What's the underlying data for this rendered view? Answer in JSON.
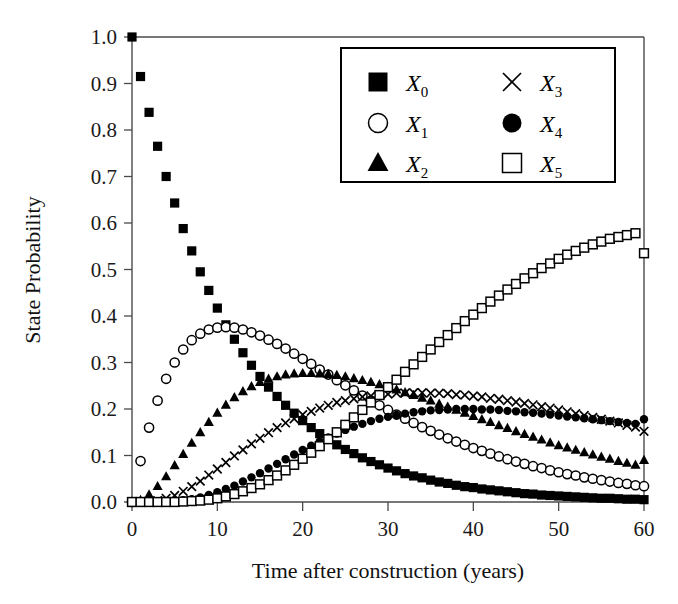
{
  "chart_data": {
    "type": "scatter",
    "title": "",
    "xlabel": "Time after construction (years)",
    "ylabel": "State Probability",
    "xlim": [
      0,
      60
    ],
    "ylim": [
      0.0,
      1.0
    ],
    "grid": false,
    "legend_position": "top-right",
    "xticks": [
      0,
      10,
      20,
      30,
      40,
      50,
      60
    ],
    "xtick_labels": [
      "0",
      "10",
      "20",
      "30",
      "40",
      "50",
      "60"
    ],
    "yticks": [
      0.0,
      0.1,
      0.2,
      0.3,
      0.4,
      0.5,
      0.6,
      0.7,
      0.8,
      0.9,
      1.0
    ],
    "ytick_labels": [
      "0.0",
      "0.1",
      "0.2",
      "0.3",
      "0.4",
      "0.5",
      "0.6",
      "0.7",
      "0.8",
      "0.9",
      "1.0"
    ],
    "x": [
      0,
      1,
      2,
      3,
      4,
      5,
      6,
      7,
      8,
      9,
      10,
      11,
      12,
      13,
      14,
      15,
      16,
      17,
      18,
      19,
      20,
      21,
      22,
      23,
      24,
      25,
      26,
      27,
      28,
      29,
      30,
      31,
      32,
      33,
      34,
      35,
      36,
      37,
      38,
      39,
      40,
      41,
      42,
      43,
      44,
      45,
      46,
      47,
      48,
      49,
      50,
      51,
      52,
      53,
      54,
      55,
      56,
      57,
      58,
      59,
      60
    ],
    "series": [
      {
        "name": "X0",
        "marker": "filled-square",
        "values": [
          1.0,
          0.915,
          0.838,
          0.765,
          0.7,
          0.643,
          0.588,
          0.54,
          0.495,
          0.455,
          0.417,
          0.381,
          0.35,
          0.321,
          0.294,
          0.27,
          0.247,
          0.227,
          0.208,
          0.191,
          0.175,
          0.16,
          0.147,
          0.135,
          0.123,
          0.113,
          0.104,
          0.095,
          0.087,
          0.08,
          0.073,
          0.067,
          0.061,
          0.056,
          0.052,
          0.047,
          0.043,
          0.04,
          0.036,
          0.033,
          0.031,
          0.028,
          0.026,
          0.024,
          0.022,
          0.02,
          0.018,
          0.017,
          0.015,
          0.014,
          0.013,
          0.012,
          0.011,
          0.01,
          0.009,
          0.008,
          0.008,
          0.007,
          0.006,
          0.006,
          0.005
        ]
      },
      {
        "name": "X1",
        "marker": "open-circle",
        "values": [
          0.0,
          0.088,
          0.16,
          0.218,
          0.265,
          0.3,
          0.328,
          0.348,
          0.362,
          0.371,
          0.375,
          0.376,
          0.375,
          0.371,
          0.365,
          0.358,
          0.349,
          0.34,
          0.33,
          0.319,
          0.308,
          0.297,
          0.285,
          0.274,
          0.262,
          0.251,
          0.24,
          0.229,
          0.218,
          0.208,
          0.198,
          0.188,
          0.179,
          0.17,
          0.161,
          0.153,
          0.145,
          0.137,
          0.13,
          0.123,
          0.116,
          0.11,
          0.104,
          0.098,
          0.092,
          0.087,
          0.082,
          0.077,
          0.073,
          0.068,
          0.064,
          0.06,
          0.057,
          0.053,
          0.05,
          0.047,
          0.044,
          0.041,
          0.039,
          0.036,
          0.034
        ]
      },
      {
        "name": "X2",
        "marker": "filled-triangle",
        "values": [
          0.0,
          0.004,
          0.016,
          0.034,
          0.055,
          0.079,
          0.103,
          0.127,
          0.15,
          0.172,
          0.192,
          0.209,
          0.225,
          0.238,
          0.249,
          0.258,
          0.265,
          0.27,
          0.274,
          0.276,
          0.277,
          0.277,
          0.276,
          0.275,
          0.273,
          0.27,
          0.266,
          0.262,
          0.258,
          0.253,
          0.248,
          0.242,
          0.236,
          0.23,
          0.224,
          0.218,
          0.211,
          0.205,
          0.198,
          0.192,
          0.185,
          0.178,
          0.172,
          0.165,
          0.159,
          0.152,
          0.146,
          0.14,
          0.134,
          0.128,
          0.122,
          0.117,
          0.112,
          0.107,
          0.102,
          0.097,
          0.093,
          0.088,
          0.084,
          0.08,
          0.09
        ]
      },
      {
        "name": "X3",
        "marker": "cross",
        "values": [
          0.0,
          0.0,
          0.001,
          0.003,
          0.008,
          0.014,
          0.023,
          0.033,
          0.045,
          0.058,
          0.071,
          0.085,
          0.099,
          0.112,
          0.125,
          0.137,
          0.149,
          0.16,
          0.17,
          0.179,
          0.188,
          0.195,
          0.202,
          0.208,
          0.214,
          0.218,
          0.222,
          0.226,
          0.228,
          0.231,
          0.232,
          0.234,
          0.234,
          0.235,
          0.235,
          0.234,
          0.234,
          0.233,
          0.231,
          0.23,
          0.228,
          0.226,
          0.223,
          0.221,
          0.218,
          0.215,
          0.212,
          0.209,
          0.205,
          0.202,
          0.198,
          0.194,
          0.19,
          0.186,
          0.182,
          0.178,
          0.174,
          0.17,
          0.165,
          0.161,
          0.152
        ]
      },
      {
        "name": "X4",
        "marker": "filled-circle",
        "values": [
          0.0,
          0.0,
          0.0,
          0.0,
          0.001,
          0.002,
          0.004,
          0.006,
          0.01,
          0.015,
          0.021,
          0.028,
          0.035,
          0.044,
          0.053,
          0.062,
          0.072,
          0.082,
          0.092,
          0.102,
          0.112,
          0.121,
          0.13,
          0.139,
          0.147,
          0.155,
          0.162,
          0.168,
          0.174,
          0.179,
          0.183,
          0.187,
          0.19,
          0.193,
          0.195,
          0.197,
          0.198,
          0.199,
          0.2,
          0.2,
          0.2,
          0.199,
          0.199,
          0.198,
          0.196,
          0.195,
          0.193,
          0.192,
          0.19,
          0.188,
          0.186,
          0.184,
          0.182,
          0.18,
          0.178,
          0.176,
          0.174,
          0.172,
          0.17,
          0.168,
          0.178
        ]
      },
      {
        "name": "X5",
        "marker": "open-square",
        "values": [
          0.0,
          0.0,
          0.0,
          0.0,
          0.0,
          0.0,
          0.001,
          0.002,
          0.003,
          0.005,
          0.008,
          0.012,
          0.017,
          0.023,
          0.03,
          0.038,
          0.047,
          0.057,
          0.068,
          0.08,
          0.093,
          0.106,
          0.12,
          0.135,
          0.15,
          0.166,
          0.182,
          0.198,
          0.214,
          0.23,
          0.247,
          0.263,
          0.28,
          0.296,
          0.312,
          0.328,
          0.344,
          0.359,
          0.374,
          0.389,
          0.403,
          0.417,
          0.431,
          0.444,
          0.457,
          0.469,
          0.481,
          0.492,
          0.503,
          0.513,
          0.523,
          0.532,
          0.54,
          0.547,
          0.554,
          0.56,
          0.566,
          0.57,
          0.574,
          0.578,
          0.535
        ]
      }
    ]
  },
  "legend": {
    "entries": [
      {
        "marker": "filled-square",
        "base": "X",
        "sub": "0"
      },
      {
        "marker": "open-circle",
        "base": "X",
        "sub": "1"
      },
      {
        "marker": "filled-triangle",
        "base": "X",
        "sub": "2"
      },
      {
        "marker": "cross",
        "base": "X",
        "sub": "3"
      },
      {
        "marker": "filled-circle",
        "base": "X",
        "sub": "4"
      },
      {
        "marker": "open-square",
        "base": "X",
        "sub": "5"
      }
    ]
  },
  "colors": {
    "marker": "#000000",
    "axis": "#4a4a4a",
    "text": "#1a1a1a",
    "background": "#ffffff"
  }
}
